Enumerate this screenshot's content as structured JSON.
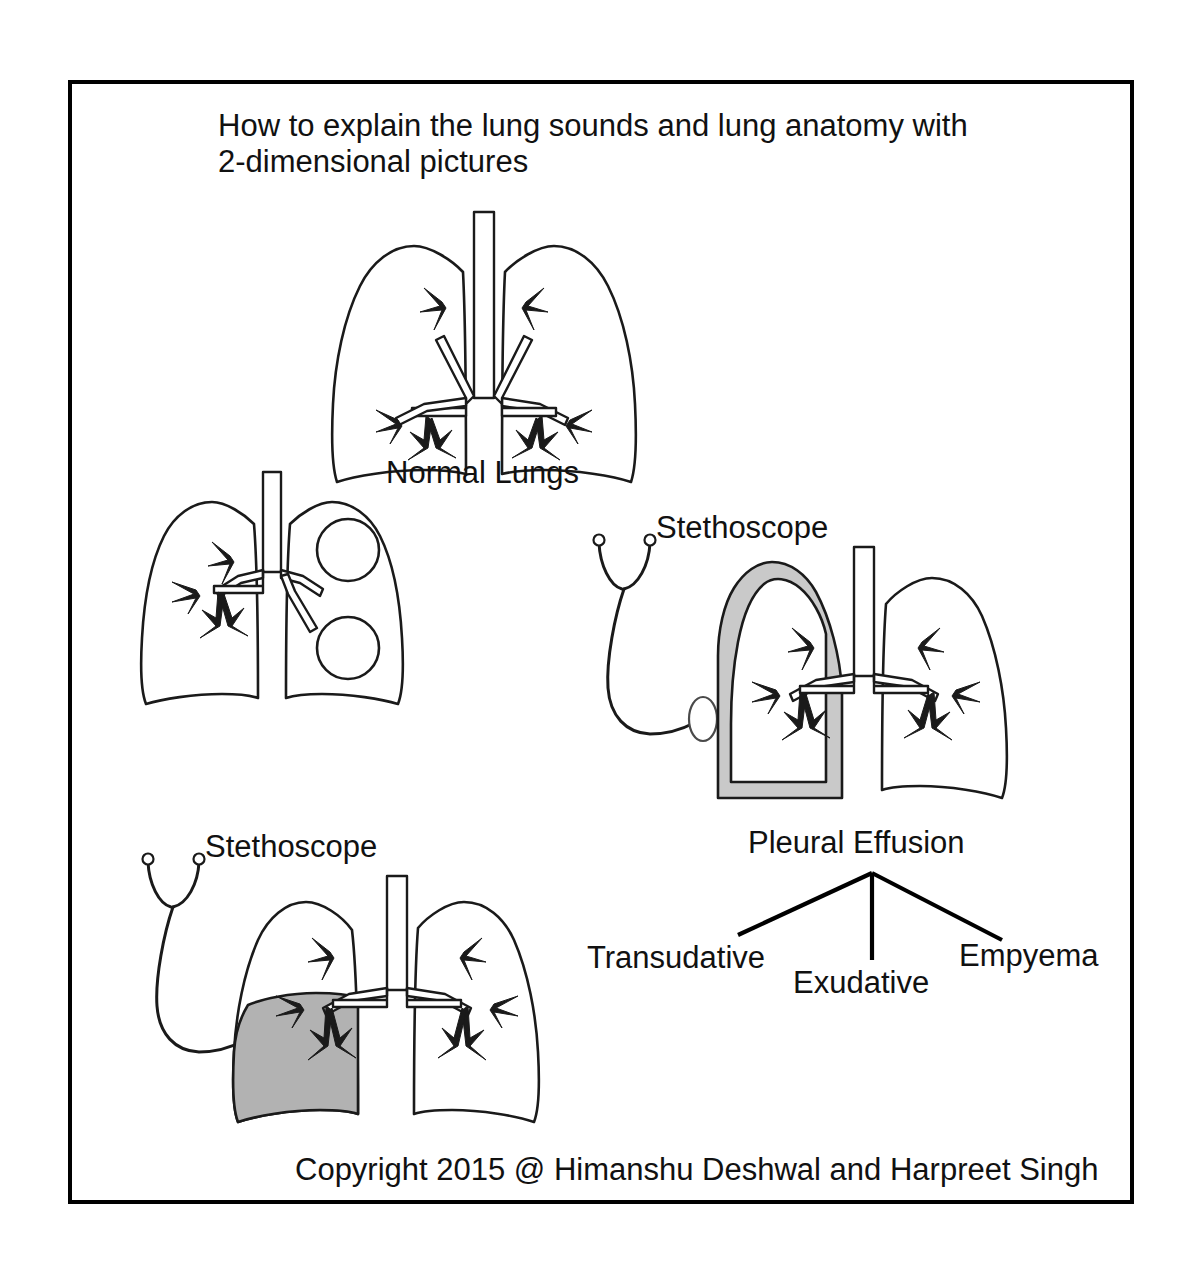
{
  "figure": {
    "title_line1": "How to explain the lung sounds and lung anatomy with",
    "title_line2": "2-dimensional pictures",
    "copyright": "Copyright 2015 @ Himanshu Deshwal and Harpreet Singh",
    "border_color": "#000000",
    "background_color": "#ffffff"
  },
  "panels": {
    "normal_lungs": {
      "label": "Normal Lungs",
      "description": "Line drawing of both lungs with trachea and bronchial tree, no shading"
    },
    "cystic_lungs": {
      "label": "",
      "description": "Lungs with two large circular cysts in the right lung field connected to bronchi"
    },
    "pleural_effusion": {
      "label": "Pleural Effusion",
      "stethoscope_label": "Stethoscope",
      "fluid_color": "#c9c9c9",
      "description": "Lungs with light gray fluid rim surrounding the compressed left lung"
    },
    "empyema_lung": {
      "label": "",
      "stethoscope_label": "Stethoscope",
      "fill_color": "#b2b2b2",
      "description": "Lungs with solid gray consolidation filling the lower left lung field"
    }
  },
  "classification": {
    "parent": "Pleural Effusion",
    "children": [
      {
        "label": "Transudative"
      },
      {
        "label": "Exudative"
      },
      {
        "label": "Empyema"
      }
    ]
  },
  "icons": {
    "stethoscope": "stethoscope-icon",
    "lungs": "lungs-icon",
    "trachea": "trachea-icon",
    "cyst": "cyst-icon"
  }
}
